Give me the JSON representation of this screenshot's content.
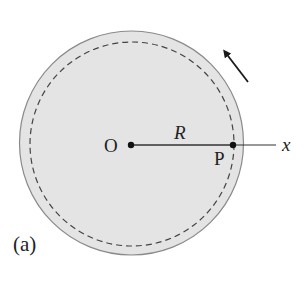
{
  "figure": {
    "panel_label": "(a)",
    "center_label": "O",
    "point_label": "P",
    "radius_label": "R",
    "axis_label": "x",
    "rotation_direction": "counterclockwise"
  },
  "colors": {
    "disk_fill": "#e4e4e4",
    "disk_stroke": "#8a8a8a",
    "dashed": "#444444",
    "ink": "#1a1a1a"
  }
}
